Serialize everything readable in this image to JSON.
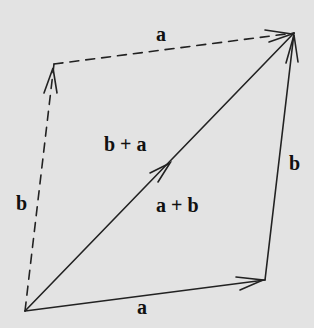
{
  "diagram": {
    "vertices": {
      "origin": [
        25,
        311
      ],
      "a_end": [
        265,
        280
      ],
      "sum_end": [
        294,
        33
      ],
      "b_end": [
        54,
        64
      ]
    },
    "vectors": [
      {
        "id": "a-bottom",
        "name": "a",
        "style": "solid",
        "from": [
          25,
          311
        ],
        "to": [
          265,
          280
        ]
      },
      {
        "id": "b-right",
        "name": "b",
        "style": "solid",
        "from": [
          265,
          280
        ],
        "to": [
          294,
          33
        ]
      },
      {
        "id": "b-left",
        "name": "b",
        "style": "dashed",
        "from": [
          25,
          311
        ],
        "to": [
          54,
          64
        ]
      },
      {
        "id": "a-top",
        "name": "a",
        "style": "dashed",
        "from": [
          54,
          64
        ],
        "to": [
          294,
          33
        ]
      },
      {
        "id": "sum",
        "name": "a + b",
        "style": "solid",
        "from": [
          25,
          311
        ],
        "to": [
          294,
          33
        ]
      }
    ],
    "labels": {
      "a_bottom": "a",
      "b_right": "b",
      "b_left": "b",
      "a_top": "a",
      "sum_lower": "a + b",
      "sum_upper": "b + a"
    },
    "colors": {
      "background": "#e3e3e3",
      "stroke": "#222222",
      "text": "#111111"
    }
  }
}
